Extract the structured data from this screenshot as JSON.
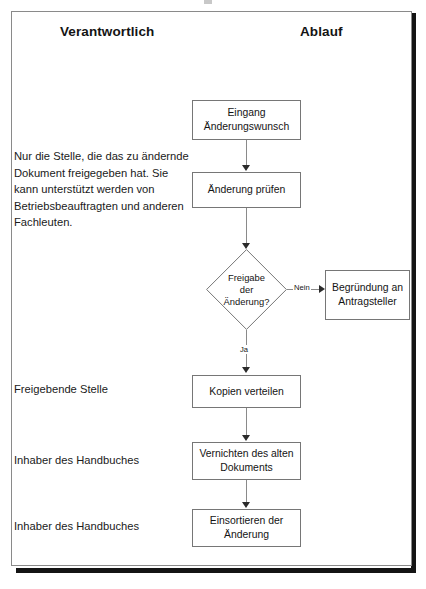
{
  "document": {
    "title": "Ablaufdiagramm Änderungswunsch",
    "language": "de"
  },
  "headers": {
    "left_column": "Verantwortlich",
    "right_column": "Ablauf"
  },
  "responsibilities": {
    "note": "Nur die Stelle, die das zu ändernde Dokument freigegeben hat. Sie kann unterstützt werden von Betriebsbeauftragten und anderen Fachleuten.",
    "freigebende_stelle": "Freigebende Stelle",
    "inhaber_handbuches_1": "Inhaber des Handbuches",
    "inhaber_handbuches_2": "Inhaber des Handbuches"
  },
  "flow": {
    "nodes": [
      {
        "id": "eingang",
        "type": "process",
        "label": "Eingang\nÄnderungswunsch"
      },
      {
        "id": "pruefen",
        "type": "process",
        "label": "Änderung prüfen"
      },
      {
        "id": "freigabe",
        "type": "decision",
        "label": "Freigabe\nder\nÄnderung?"
      },
      {
        "id": "begruendung",
        "type": "process",
        "label": "Begründung an\nAntragsteller"
      },
      {
        "id": "kopien",
        "type": "process",
        "label": "Kopien verteilen"
      },
      {
        "id": "vernichten",
        "type": "process",
        "label": "Vernichten des alten\nDokuments"
      },
      {
        "id": "einsortieren",
        "type": "process",
        "label": "Einsortieren der\nÄnderung"
      }
    ],
    "edge_labels": {
      "nein": "Nein",
      "ja": "Ja"
    }
  },
  "node_text": {
    "eingang_line1": "Eingang",
    "eingang_line2": "Änderungswunsch",
    "pruefen": "Änderung prüfen",
    "freigabe_line1": "Freigabe",
    "freigabe_line2": "der",
    "freigabe_line3": "Änderung?",
    "begruendung_line1": "Begründung an",
    "begruendung_line2": "Antragsteller",
    "kopien": "Kopien verteilen",
    "vernichten_line1": "Vernichten des alten",
    "vernichten_line2": "Dokuments",
    "einsortieren_line1": "Einsortieren der",
    "einsortieren_line2": "Änderung"
  },
  "colors": {
    "page_background": "#ffffff",
    "frame_line": "#8a8a8a",
    "frame_shadow": "#141414",
    "node_border": "#767676",
    "text": "#141414",
    "connector": "#8a8a8a",
    "arrow": "#2b2b2b"
  }
}
